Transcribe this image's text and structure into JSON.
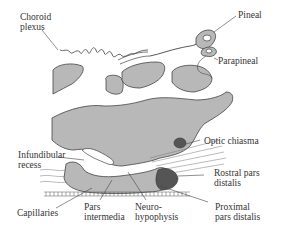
{
  "diagram": {
    "type": "anatomical-sagittal-section",
    "colors": {
      "tissue_fill": "#b8b8b8",
      "outline": "#444444",
      "dark_region": "#555555",
      "text": "#333333",
      "background": "#ffffff"
    },
    "labels": {
      "choroid_plexus": "Choroid\nplexus",
      "pineal": "Pineal",
      "parapineal": "Parapineal",
      "optic_chiasma": "Optic chiasma",
      "infundibular_recess": "Infundibular\nrecess",
      "rostral_pars_distalis": "Rostral pars\ndistalis",
      "capillaries": "Capillaries",
      "pars_intermedia": "Pars\nintermedia",
      "neurohypophysis": "Neuro-\nhypophysis",
      "proximal_pars_distalis": "Proximal\npars distalis"
    }
  }
}
